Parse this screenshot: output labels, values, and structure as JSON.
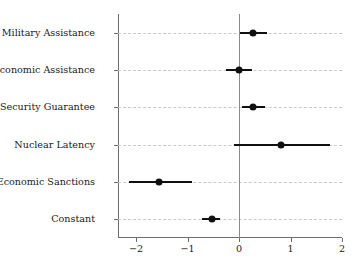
{
  "chart_data": {
    "type": "scatter",
    "title": "",
    "subtitle": "",
    "xlabel": "",
    "ylabel": "",
    "xlim": [
      -2.35,
      2.0
    ],
    "ylim": [
      0,
      6
    ],
    "grid": "horizontal-dashed",
    "legend": "none",
    "orientation": "horizontal",
    "zero_reference_line": 0,
    "xticks": [
      -2,
      -1,
      0,
      1,
      2
    ],
    "xticklabels": [
      "−2",
      "−1",
      "0",
      "1",
      "2"
    ],
    "categories": [
      "U.S. Military Assistance",
      "U.S. Economic Assistance",
      "U.S. Security Guarantee",
      "Nuclear Latency",
      "U.S. Economic Sanctions",
      "Constant"
    ],
    "points": [
      {
        "label": "U.S. Military Assistance",
        "estimate": 0.28,
        "ci_low": 0.02,
        "ci_high": 0.55
      },
      {
        "label": "U.S. Economic Assistance",
        "estimate": 0.0,
        "ci_low": -0.25,
        "ci_high": 0.26
      },
      {
        "label": "U.S. Security Guarantee",
        "estimate": 0.28,
        "ci_low": 0.06,
        "ci_high": 0.5
      },
      {
        "label": "Nuclear Latency",
        "estimate": 0.81,
        "ci_low": -0.09,
        "ci_high": 1.76
      },
      {
        "label": "U.S. Economic Sanctions",
        "estimate": -1.55,
        "ci_low": -2.14,
        "ci_high": -0.91
      },
      {
        "label": "Constant",
        "estimate": -0.53,
        "ci_low": -0.71,
        "ci_high": -0.37
      }
    ],
    "colors": {
      "marker": "#101010",
      "ci_line": "#101010",
      "gridline": "#c9c9c9",
      "zero_line": "#8a8a8a",
      "axis": "#6e6e6e",
      "background": "#ffffff"
    }
  },
  "caption": {
    "text": " "
  }
}
